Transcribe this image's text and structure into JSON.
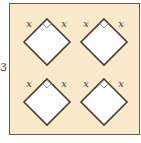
{
  "figure": {
    "side_label": "3",
    "panel_fill": "#fbe9cc",
    "panel_border": "#6b5a48",
    "diamond_fill": "#ffffff",
    "diamond_stroke": "#4a3a2c",
    "right_angle_color": "#7a95b5",
    "label_color": "#3a3a3a",
    "diamonds": [
      {
        "cx": 47,
        "cy": 42,
        "labels": [
          "x",
          "x"
        ]
      },
      {
        "cx": 104,
        "cy": 42,
        "labels": [
          "x",
          "x"
        ]
      },
      {
        "cx": 47,
        "cy": 102,
        "labels": [
          "x",
          "x"
        ]
      },
      {
        "cx": 104,
        "cy": 102,
        "labels": [
          "x",
          "x"
        ]
      }
    ]
  }
}
